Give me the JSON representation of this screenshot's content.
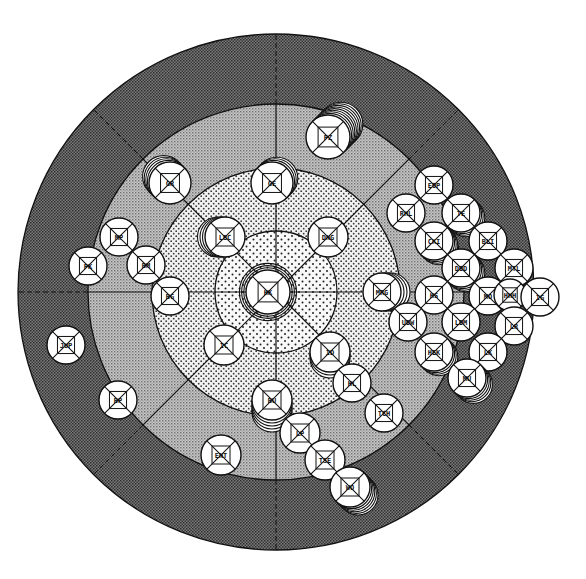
{
  "diagram": {
    "type": "radial-bullseye",
    "center": {
      "x": 276,
      "y": 292
    },
    "rings": [
      {
        "name": "outer",
        "radius": 258,
        "pattern": "dark-dither",
        "color": "#5a5a5a"
      },
      {
        "name": "second",
        "radius": 188,
        "pattern": "medium-dither",
        "color": "#a8a8a8"
      },
      {
        "name": "third",
        "radius": 124,
        "pattern": "light-dots",
        "color": "#d6d6d6"
      },
      {
        "name": "core",
        "radius": 61,
        "pattern": "sparse-dots",
        "color": "#e4e4e4"
      }
    ],
    "spokes": {
      "count": 8,
      "solid_to_radius": 188,
      "dashed_to_radius": 258
    },
    "nodes": [
      {
        "id": "n-center",
        "label": "HK",
        "x": 268,
        "y": 292,
        "r": 22,
        "stack": 3,
        "stack_dir": "ring"
      },
      {
        "id": "n-top",
        "label": "GE",
        "x": 272,
        "y": 183,
        "r": 21,
        "stack": 3,
        "stack_dir": "ne"
      },
      {
        "id": "n-tl2",
        "label": "GR",
        "x": 170,
        "y": 183,
        "r": 21,
        "stack": 4,
        "stack_dir": "nw"
      },
      {
        "id": "n-lbc",
        "label": "LBC",
        "x": 225,
        "y": 237,
        "r": 20,
        "stack": 3,
        "stack_dir": "w"
      },
      {
        "id": "n-dng",
        "label": "DNG",
        "x": 328,
        "y": 237,
        "r": 20,
        "stack": 0,
        "stack_dir": "none"
      },
      {
        "id": "n-farr",
        "label": "PZ",
        "x": 328,
        "y": 137,
        "r": 22,
        "stack": 8,
        "stack_dir": "ne"
      },
      {
        "id": "n-l1",
        "label": "MP",
        "x": 119,
        "y": 237,
        "r": 19,
        "stack": 0,
        "stack_dir": "none"
      },
      {
        "id": "n-l2",
        "label": "PK",
        "x": 88,
        "y": 266,
        "r": 19,
        "stack": 0,
        "stack_dir": "none"
      },
      {
        "id": "n-l3",
        "label": "BM",
        "x": 146,
        "y": 265,
        "r": 19,
        "stack": 0,
        "stack_dir": "none"
      },
      {
        "id": "n-l4",
        "label": "BG",
        "x": 170,
        "y": 296,
        "r": 19,
        "stack": 0,
        "stack_dir": "none"
      },
      {
        "id": "n-l5",
        "label": "JUP",
        "x": 66,
        "y": 345,
        "r": 19,
        "stack": 0,
        "stack_dir": "none"
      },
      {
        "id": "n-l6",
        "label": "BP",
        "x": 118,
        "y": 400,
        "r": 19,
        "stack": 0,
        "stack_dir": "none"
      },
      {
        "id": "n-ic",
        "label": "IC",
        "x": 224,
        "y": 345,
        "r": 20,
        "stack": 0,
        "stack_dir": "none"
      },
      {
        "id": "n-id",
        "label": "ID",
        "x": 330,
        "y": 352,
        "r": 20,
        "stack": 2,
        "stack_dir": "s"
      },
      {
        "id": "n-hl",
        "label": "HL",
        "x": 352,
        "y": 383,
        "r": 19,
        "stack": 0,
        "stack_dir": "none"
      },
      {
        "id": "n-tch",
        "label": "TCH",
        "x": 384,
        "y": 413,
        "r": 19,
        "stack": 0,
        "stack_dir": "none"
      },
      {
        "id": "n-bu",
        "label": "BU",
        "x": 272,
        "y": 400,
        "r": 20,
        "stack": 4,
        "stack_dir": "s"
      },
      {
        "id": "n-lp",
        "label": "LP",
        "x": 300,
        "y": 433,
        "r": 20,
        "stack": 0,
        "stack_dir": "none"
      },
      {
        "id": "n-tse",
        "label": "TSE",
        "x": 325,
        "y": 460,
        "r": 20,
        "stack": 0,
        "stack_dir": "none"
      },
      {
        "id": "n-wo",
        "label": "WO",
        "x": 350,
        "y": 487,
        "r": 20,
        "stack": 5,
        "stack_dir": "se"
      },
      {
        "id": "n-ent",
        "label": "ENT",
        "x": 221,
        "y": 455,
        "r": 20,
        "stack": 0,
        "stack_dir": "none"
      },
      {
        "id": "n-mrg",
        "label": "MRG",
        "x": 382,
        "y": 292,
        "r": 19,
        "stack": 3,
        "stack_dir": "e"
      },
      {
        "id": "n-r1",
        "label": "EOP",
        "x": 434,
        "y": 185,
        "r": 19,
        "stack": 0,
        "stack_dir": "none"
      },
      {
        "id": "n-r2",
        "label": "RHL",
        "x": 406,
        "y": 213,
        "r": 19,
        "stack": 0,
        "stack_dir": "none"
      },
      {
        "id": "n-r3",
        "label": "TE",
        "x": 461,
        "y": 213,
        "r": 19,
        "stack": 3,
        "stack_dir": "se"
      },
      {
        "id": "n-r4",
        "label": "CKI",
        "x": 434,
        "y": 241,
        "r": 19,
        "stack": 3,
        "stack_dir": "se"
      },
      {
        "id": "n-r5",
        "label": "BLI",
        "x": 488,
        "y": 241,
        "r": 19,
        "stack": 0,
        "stack_dir": "none"
      },
      {
        "id": "n-r6",
        "label": "DOD",
        "x": 461,
        "y": 268,
        "r": 19,
        "stack": 3,
        "stack_dir": "se"
      },
      {
        "id": "n-r7",
        "label": "MTL",
        "x": 514,
        "y": 268,
        "r": 19,
        "stack": 0,
        "stack_dir": "none"
      },
      {
        "id": "n-r8",
        "label": "HS",
        "x": 434,
        "y": 295,
        "r": 19,
        "stack": 0,
        "stack_dir": "none"
      },
      {
        "id": "n-r9",
        "label": "MO",
        "x": 488,
        "y": 296,
        "r": 19,
        "stack": 0,
        "stack_dir": "none"
      },
      {
        "id": "n-r10",
        "label": "HHH",
        "x": 510,
        "y": 295,
        "r": 16,
        "stack": 0,
        "stack_dir": "none"
      },
      {
        "id": "n-r11",
        "label": "IG",
        "x": 540,
        "y": 297,
        "r": 19,
        "stack": 0,
        "stack_dir": "none"
      },
      {
        "id": "n-r12",
        "label": "UDW",
        "x": 408,
        "y": 322,
        "r": 19,
        "stack": 0,
        "stack_dir": "none"
      },
      {
        "id": "n-r13",
        "label": "LR",
        "x": 514,
        "y": 326,
        "r": 19,
        "stack": 0,
        "stack_dir": "none"
      },
      {
        "id": "n-r14",
        "label": "LDM",
        "x": 461,
        "y": 322,
        "r": 19,
        "stack": 0,
        "stack_dir": "none"
      },
      {
        "id": "n-r15",
        "label": "HEK",
        "x": 434,
        "y": 352,
        "r": 19,
        "stack": 3,
        "stack_dir": "se"
      },
      {
        "id": "n-r16",
        "label": "LK",
        "x": 488,
        "y": 352,
        "r": 19,
        "stack": 0,
        "stack_dir": "none"
      },
      {
        "id": "n-r17",
        "label": "MU",
        "x": 467,
        "y": 378,
        "r": 19,
        "stack": 4,
        "stack_dir": "se"
      }
    ]
  }
}
